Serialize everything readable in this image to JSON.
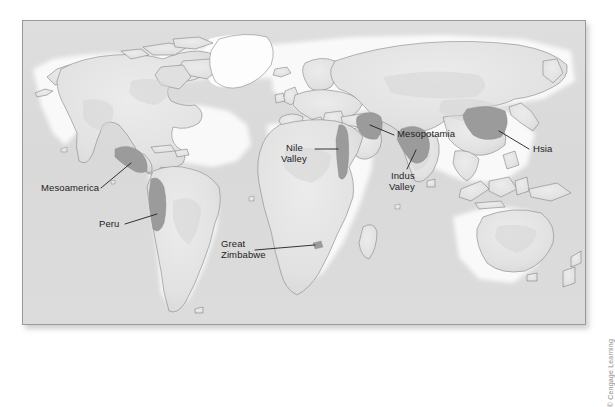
{
  "figure": {
    "type": "world-map",
    "title": "",
    "credit": "© Cengage Learning",
    "frame": {
      "border_color": "#9a9a9a",
      "background_color": "#dcdcdc"
    }
  },
  "map": {
    "projection": "world-equirectangular",
    "land_color": "#e4e4e4",
    "land_outline_color": "#7e7e7e",
    "ocean_color": "#dadada",
    "highlight_color": "#9a9a9a",
    "ice_color": "#fbfbfb"
  },
  "labels": [
    {
      "id": "mesoamerica",
      "text": "Mesoamerica",
      "lines": [
        "Mesoamerica"
      ]
    },
    {
      "id": "peru",
      "text": "Peru",
      "lines": [
        "Peru"
      ]
    },
    {
      "id": "great-zimbabwe",
      "text": "Great Zimbabwe",
      "lines": [
        "Great",
        "Zimbabwe"
      ]
    },
    {
      "id": "nile-valley",
      "text": "Nile Valley",
      "lines": [
        "Nile",
        "Valley"
      ]
    },
    {
      "id": "mesopotamia",
      "text": "Mesopotamia",
      "lines": [
        "Mesopotamia"
      ]
    },
    {
      "id": "indus-valley",
      "text": "Indus Valley",
      "lines": [
        "Indus",
        "Valley"
      ]
    },
    {
      "id": "hsia",
      "text": "Hsia",
      "lines": [
        "Hsia"
      ]
    }
  ],
  "label_text": {
    "mesoamerica": "Mesoamerica",
    "peru": "Peru",
    "great_zimbabwe_1": "Great",
    "great_zimbabwe_2": "Zimbabwe",
    "nile_1": "Nile",
    "nile_2": "Valley",
    "mesopotamia": "Mesopotamia",
    "indus_1": "Indus",
    "indus_2": "Valley",
    "hsia": "Hsia"
  },
  "regions": [
    {
      "name": "Mesoamerica",
      "continent": "North America",
      "highlighted": true
    },
    {
      "name": "Peru",
      "continent": "South America",
      "highlighted": true
    },
    {
      "name": "Great Zimbabwe",
      "continent": "Africa",
      "highlighted": true
    },
    {
      "name": "Nile Valley",
      "continent": "Africa",
      "highlighted": true
    },
    {
      "name": "Mesopotamia",
      "continent": "Asia",
      "highlighted": true
    },
    {
      "name": "Indus Valley",
      "continent": "Asia",
      "highlighted": true
    },
    {
      "name": "Hsia",
      "continent": "Asia",
      "highlighted": true
    }
  ]
}
